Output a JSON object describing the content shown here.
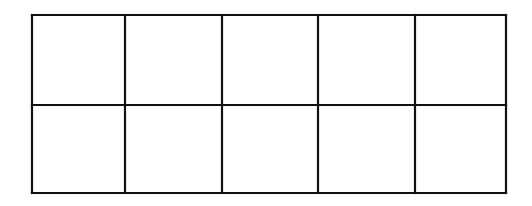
{
  "diagram": {
    "type": "empty-grid",
    "rows": 2,
    "columns": 5,
    "cell_count": 10,
    "x_lines": [
      32,
      125,
      222,
      318,
      415,
      506
    ],
    "y_lines": [
      15,
      105,
      193
    ],
    "stroke_color": "#111111",
    "background_color": "#ffffff",
    "stroke_width": 2.2
  }
}
